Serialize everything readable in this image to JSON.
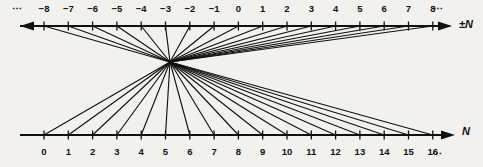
{
  "diagram": {
    "top_axis": {
      "name": "pm-n-axis",
      "label": "±N",
      "arrow_direction": "left",
      "leading_ellipsis": "⋯",
      "trailing_ellipsis": "⋯",
      "tick_labels": [
        "−8",
        "−7",
        "−6",
        "−5",
        "−4",
        "−3",
        "−2",
        "−1",
        "0",
        "1",
        "2",
        "3",
        "4",
        "5",
        "6",
        "7",
        "8"
      ],
      "tick_values": [
        -8,
        -7,
        -6,
        -5,
        -4,
        -3,
        -2,
        -1,
        0,
        1,
        2,
        3,
        4,
        5,
        6,
        7,
        8
      ]
    },
    "bottom_axis": {
      "name": "n-axis",
      "label": "N",
      "arrow_direction": "right",
      "trailing_ellipsis": "⋯",
      "tick_labels": [
        "0",
        "1",
        "2",
        "3",
        "4",
        "5",
        "6",
        "7",
        "8",
        "9",
        "10",
        "11",
        "12",
        "13",
        "14",
        "15",
        "16"
      ],
      "tick_values": [
        0,
        1,
        2,
        3,
        4,
        5,
        6,
        7,
        8,
        9,
        10,
        11,
        12,
        13,
        14,
        15,
        16
      ]
    },
    "hub": {
      "name": "convergence-node",
      "x": 170,
      "y": 62
    },
    "mapping": [
      {
        "integer": 0,
        "natural": 0
      },
      {
        "integer": -1,
        "natural": 1
      },
      {
        "integer": 1,
        "natural": 2
      },
      {
        "integer": -2,
        "natural": 3
      },
      {
        "integer": 2,
        "natural": 4
      },
      {
        "integer": -3,
        "natural": 5
      },
      {
        "integer": 3,
        "natural": 6
      },
      {
        "integer": -4,
        "natural": 7
      },
      {
        "integer": 4,
        "natural": 8
      },
      {
        "integer": -5,
        "natural": 9
      },
      {
        "integer": 5,
        "natural": 10
      },
      {
        "integer": -6,
        "natural": 11
      },
      {
        "integer": 6,
        "natural": 12
      },
      {
        "integer": -7,
        "natural": 13
      },
      {
        "integer": 7,
        "natural": 14
      },
      {
        "integer": -8,
        "natural": 15
      },
      {
        "integer": 8,
        "natural": 16
      }
    ],
    "colors": {
      "ink": "#111111",
      "background": "#f2f1ee"
    }
  }
}
